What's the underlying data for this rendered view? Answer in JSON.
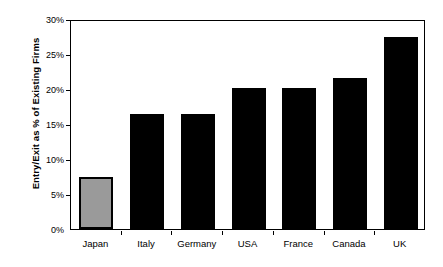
{
  "chart_data": {
    "type": "bar",
    "title": "",
    "subtitle": "",
    "xlabel": "",
    "ylabel": "Entry/Exit as % of Existing Firms",
    "categories": [
      "Japan",
      "Italy",
      "Germany",
      "USA",
      "France",
      "Canada",
      "UK"
    ],
    "values": [
      7.5,
      16.4,
      16.5,
      20.1,
      20.2,
      21.6,
      27.5
    ],
    "value_labels": [
      "7.5%",
      "16.4%",
      "16.5%",
      "20.1%",
      "20.2%",
      "21.6%",
      "27.5%"
    ],
    "ylim": [
      0,
      30
    ],
    "ytick_values": [
      0,
      5,
      10,
      15,
      20,
      25,
      30
    ],
    "ytick_labels": [
      "0%",
      "5%",
      "10%",
      "15%",
      "20%",
      "25%",
      "30%"
    ],
    "grid": false,
    "legend": "none",
    "series": [
      {
        "name": "Entry/Exit as % of Existing Firms",
        "values": [
          7.5,
          16.4,
          16.5,
          20.1,
          20.2,
          21.6,
          27.5
        ]
      }
    ],
    "bar_colors": [
      "#9a9a9a",
      "#000000",
      "#000000",
      "#000000",
      "#000000",
      "#000000",
      "#000000"
    ],
    "highlighted_category": "Japan",
    "colors": {
      "bar_default": "#000000",
      "bar_highlight": "#9a9a9a",
      "bar_highlight_border": "#000000",
      "axis": "#000000",
      "plot_background": "#ffffff",
      "text": "#000000"
    }
  },
  "artifact": {
    "top_strip": ""
  }
}
